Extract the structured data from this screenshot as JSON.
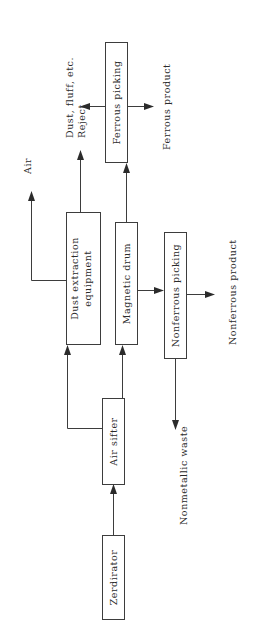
{
  "diagram": {
    "type": "process-flow",
    "orientation": "rotated-90-ccw",
    "colors": {
      "background": "#ffffff",
      "stroke": "#3d3d3d",
      "text": "#2b2b2b",
      "arrow": "#2b2b2b"
    },
    "nodes": [
      {
        "id": "zerdirator",
        "label": "Zerdirator"
      },
      {
        "id": "air-sifter",
        "label": "Air sifter"
      },
      {
        "id": "dust-extraction",
        "label": "Dust extraction",
        "label_line2": "equipment"
      },
      {
        "id": "magnetic-drum",
        "label": "Magnetic drum"
      },
      {
        "id": "ferrous-picking",
        "label": "Ferrous picking"
      },
      {
        "id": "nonferrous-picking",
        "label": "Nonferrous picking"
      }
    ],
    "flow_labels": [
      {
        "id": "air",
        "label": "Air"
      },
      {
        "id": "dust-fluff",
        "label": "Dust, fluff, etc."
      },
      {
        "id": "reject",
        "label": "Reject"
      },
      {
        "id": "ferrous-product",
        "label": "Ferrous product"
      },
      {
        "id": "nonferrous-product",
        "label": "Nonferrous product"
      },
      {
        "id": "nonmetallic-waste",
        "label": "Nonmetallic waste"
      }
    ],
    "edges": [
      {
        "from": "zerdirator",
        "to": "air-sifter"
      },
      {
        "from": "air-sifter",
        "to": "magnetic-drum"
      },
      {
        "from": "air-sifter",
        "to": "dust-extraction"
      },
      {
        "from": "dust-extraction",
        "to": "air"
      },
      {
        "from": "dust-extraction",
        "to": "dust-fluff"
      },
      {
        "from": "magnetic-drum",
        "to": "ferrous-picking"
      },
      {
        "from": "magnetic-drum",
        "to": "nonferrous-picking"
      },
      {
        "from": "ferrous-picking",
        "to": "reject"
      },
      {
        "from": "ferrous-picking",
        "to": "ferrous-product"
      },
      {
        "from": "nonferrous-picking",
        "to": "nonferrous-product"
      },
      {
        "from": "nonferrous-picking",
        "to": "nonmetallic-waste"
      }
    ]
  }
}
